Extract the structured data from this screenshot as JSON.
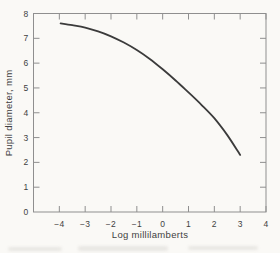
{
  "chart_data": {
    "type": "line",
    "title": "",
    "xlabel": "Log millilamberts",
    "ylabel": "Pupil diameter, mm",
    "xlim": [
      -5,
      4
    ],
    "ylim": [
      0,
      8
    ],
    "x_tick_values": [
      -4,
      -3,
      -2,
      -1,
      0,
      1,
      2,
      3,
      4
    ],
    "x_tick_labels": [
      "−4",
      "−3",
      "−2",
      "−1",
      "0",
      "1",
      "2",
      "3",
      "4"
    ],
    "y_tick_values": [
      0,
      1,
      2,
      3,
      4,
      5,
      6,
      7,
      8
    ],
    "y_tick_labels": [
      "0",
      "1",
      "2",
      "3",
      "4",
      "5",
      "6",
      "7",
      "8"
    ],
    "grid": false,
    "legend": null,
    "series": [
      {
        "name": "pupil-diameter-curve",
        "color": "#3b3b3b",
        "points": [
          [
            -3.95,
            7.6
          ],
          [
            -3.5,
            7.53
          ],
          [
            -3,
            7.43
          ],
          [
            -2.5,
            7.28
          ],
          [
            -2,
            7.08
          ],
          [
            -1.5,
            6.83
          ],
          [
            -1,
            6.53
          ],
          [
            -0.5,
            6.17
          ],
          [
            0,
            5.75
          ],
          [
            0.5,
            5.3
          ],
          [
            1,
            4.82
          ],
          [
            1.5,
            4.32
          ],
          [
            2,
            3.78
          ],
          [
            2.5,
            3.1
          ],
          [
            3,
            2.3
          ]
        ]
      }
    ]
  },
  "colors": {
    "background": "#faf9f6",
    "axis": "#8f8f8f",
    "text": "#3f3f3f",
    "curve": "#3b3b3b"
  }
}
